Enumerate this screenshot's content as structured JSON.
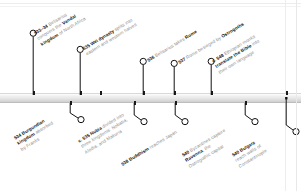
{
  "graphic": {
    "kind": "historical-timeline",
    "orientation": "horizontal",
    "axis_color": "#d9d9d9",
    "marker_color": "#1a1a1a",
    "text_color": "#8d8d8d",
    "highlight_color": "#111111",
    "label_rotation_deg": -31
  },
  "events": [
    {
      "id": "e533",
      "side": "above",
      "year": "533–34",
      "lines": [
        [
          {
            "t": "533–34 ",
            "s": "yr"
          },
          {
            "t": "Belisarius",
            "s": "plain"
          }
        ],
        [
          {
            "t": "conquers the ",
            "s": "plain"
          },
          {
            "t": "Vandal",
            "s": "em"
          }
        ],
        [
          {
            "t": "kingdom",
            "s": "em"
          },
          {
            "t": " of North Africa",
            "s": "plain"
          }
        ]
      ],
      "text": "533–34 Belisarius conquers the Vandal kingdom of North Africa"
    },
    {
      "id": "e534",
      "side": "below",
      "year": "534",
      "lines": [
        [
          {
            "t": "534 Burgundian",
            "s": "yr"
          }
        ],
        [
          {
            "t": "kingdom",
            "s": "em"
          },
          {
            "t": " absorbed",
            "s": "plain"
          }
        ],
        [
          {
            "t": "by Franks",
            "s": "plain"
          }
        ]
      ],
      "text": "534 Burgundian kingdom absorbed by Franks"
    },
    {
      "id": "e535wei",
      "side": "above",
      "year": "535",
      "lines": [
        [
          {
            "t": "535 Wei dynasty",
            "s": "yr"
          },
          {
            "t": " splits into",
            "s": "plain"
          }
        ],
        [
          {
            "t": "eastern and western halves",
            "s": "plain"
          }
        ]
      ],
      "text": "535 Wei dynasty splits into eastern and western halves"
    },
    {
      "id": "e535nubia",
      "side": "below",
      "year": "c. 535",
      "lines": [
        [
          {
            "t": "c. 535 Nubia",
            "s": "yr"
          },
          {
            "t": " divided into",
            "s": "plain"
          }
        ],
        [
          {
            "t": "three kingdoms: Nobatia,",
            "s": "plain"
          }
        ],
        [
          {
            "t": "Alodia, and Makuria",
            "s": "plain"
          }
        ]
      ],
      "text": "c. 535 Nubia divided into three kingdoms: Nobatia, Alodia, and Makuria"
    },
    {
      "id": "e536",
      "side": "above",
      "year": "536",
      "lines": [
        [
          {
            "t": "536 ",
            "s": "yr"
          },
          {
            "t": "Belisarius takes ",
            "s": "plain"
          },
          {
            "t": "Rome",
            "s": "em"
          }
        ]
      ],
      "text": "536 Belisarius takes Rome"
    },
    {
      "id": "e537",
      "side": "above",
      "year": "537",
      "lines": [
        [
          {
            "t": "537 ",
            "s": "yr"
          },
          {
            "t": "Rome besieged by ",
            "s": "plain"
          },
          {
            "t": "Ostrogoths",
            "s": "em"
          }
        ]
      ],
      "text": "537 Rome besieged by Ostrogoths"
    },
    {
      "id": "e538",
      "side": "below",
      "year": "538",
      "lines": [
        [
          {
            "t": "538 Buddhism",
            "s": "yr"
          },
          {
            "t": " reaches Japan",
            "s": "plain"
          }
        ]
      ],
      "text": "538 Buddhism reaches Japan"
    },
    {
      "id": "e540rav",
      "side": "below",
      "year": "540",
      "lines": [
        [
          {
            "t": "540 ",
            "s": "yr"
          },
          {
            "t": "Byzantines capture",
            "s": "plain"
          }
        ],
        [
          {
            "t": "Ravenna",
            "s": "em"
          },
          {
            "t": ", the",
            "s": "plain"
          }
        ],
        [
          {
            "t": "Ostrogothic capital",
            "s": "plain"
          }
        ]
      ],
      "text": "540 Byzantines capture Ravenna, the Ostrogothic capital"
    },
    {
      "id": "e548",
      "side": "above",
      "year": "c. 548",
      "lines": [
        [
          {
            "t": "c. 548 ",
            "s": "yr"
          },
          {
            "t": "Ethiopian monks",
            "s": "plain"
          }
        ],
        [
          {
            "t": "translate the Bible",
            "s": "em"
          },
          {
            "t": " into",
            "s": "plain"
          }
        ],
        [
          {
            "t": "their own language",
            "s": "plain"
          }
        ]
      ],
      "text": "c. 548 Ethiopian monks translate the Bible into their own language"
    },
    {
      "id": "e540bul",
      "side": "below",
      "year": "540",
      "lines": [
        [
          {
            "t": "540 Bulgars",
            "s": "yr"
          }
        ],
        [
          {
            "t": "reach walls of",
            "s": "plain"
          }
        ],
        [
          {
            "t": "Constantinople",
            "s": "plain"
          }
        ]
      ],
      "text": "540 Bulgars reach walls of Constantinople"
    }
  ],
  "ticks_above": [
    33,
    80,
    100,
    143,
    174,
    211,
    286
  ],
  "ticks_below": [
    70,
    134,
    175,
    245
  ]
}
